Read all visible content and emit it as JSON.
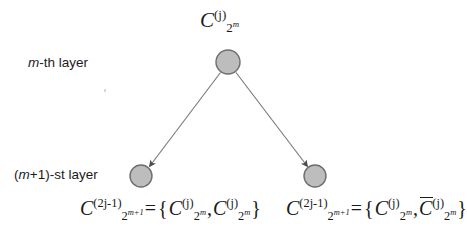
{
  "figure": {
    "background_color": "#ffffff",
    "width": 467,
    "height": 244
  },
  "labels": {
    "m_th_layer": "m-th layer",
    "m_th_layer_italic_part": "m",
    "m_th_layer_rest": "-th layer",
    "m_plus_1_layer": "(m+1)-st layer",
    "m_plus_1_prefix": "(",
    "m_plus_1_italic_part": "m",
    "m_plus_1_rest": "+1)-st layer"
  },
  "expressions": {
    "parent": {
      "plain": "C_{2^m}^{(j)}",
      "base": "C",
      "superscript": "(j)",
      "subscript_base": "2",
      "subscript_power": "m"
    },
    "left_child": {
      "plain": "C_{2^{m+1}}^{(2j-1)} = {C_{2^m}^{(j)}, C_{2^m}^{(j)}}",
      "lhs_base": "C",
      "lhs_superscript": "(2j-1)",
      "lhs_subscript_base": "2",
      "lhs_subscript_power": "m+1",
      "equals": "=",
      "open_brace": "{",
      "term1_base": "C",
      "term1_superscript": "(j)",
      "term1_subscript_base": "2",
      "term1_subscript_power": "m",
      "comma": ",",
      "term2_base": "C",
      "term2_overline": false,
      "term2_superscript": "(j)",
      "term2_subscript_base": "2",
      "term2_subscript_power": "m",
      "close_brace": "}"
    },
    "right_child": {
      "plain": "C_{2^{m+1}}^{(2j-1)} = {C_{2^m}^{(j)}, C-bar_{2^m}^{(j)}}",
      "lhs_base": "C",
      "lhs_superscript": "(2j-1)",
      "lhs_subscript_base": "2",
      "lhs_subscript_power": "m+1",
      "equals": "=",
      "open_brace": "{",
      "term1_base": "C",
      "term1_superscript": "(j)",
      "term1_subscript_base": "2",
      "term1_subscript_power": "m",
      "comma": ",",
      "term2_base": "C",
      "term2_overline": true,
      "term2_superscript": "(j)",
      "term2_subscript_base": "2",
      "term2_subscript_power": "m",
      "close_brace": "}"
    }
  },
  "graph": {
    "node_fill": "#bdbdbd",
    "node_stroke": "#6e6e6e",
    "edge_color": "#7a7a7a",
    "nodes": [
      {
        "id": "parent",
        "cx": 228,
        "cy": 62,
        "r": 12
      },
      {
        "id": "child-left",
        "cx": 141,
        "cy": 176,
        "r": 11
      },
      {
        "id": "child-right",
        "cx": 315,
        "cy": 176,
        "r": 11
      }
    ],
    "edges": [
      {
        "from": "parent",
        "to": "child-left",
        "arrow": true
      },
      {
        "from": "parent",
        "to": "child-right",
        "arrow": true
      }
    ]
  }
}
